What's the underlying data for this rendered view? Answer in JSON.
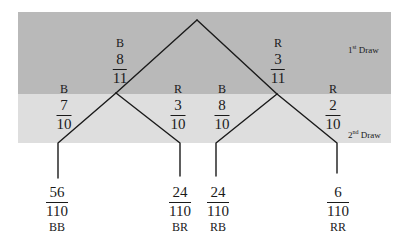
{
  "diagram": {
    "type": "probability-tree",
    "bands": {
      "first": {
        "label_num": "1",
        "label_sup": "st",
        "label_text": " Draw",
        "color": "#b9b9b9"
      },
      "second": {
        "label_num": "2",
        "label_sup": "nd",
        "label_text": " Draw",
        "color": "#dedede"
      }
    },
    "first_draw": [
      {
        "label": "B",
        "numerator": "8",
        "denominator": "11"
      },
      {
        "label": "R",
        "numerator": "3",
        "denominator": "11"
      }
    ],
    "second_draw": [
      {
        "label": "B",
        "numerator": "7",
        "denominator": "10"
      },
      {
        "label": "R",
        "numerator": "3",
        "denominator": "10"
      },
      {
        "label": "B",
        "numerator": "8",
        "denominator": "10"
      },
      {
        "label": "R",
        "numerator": "2",
        "denominator": "10"
      }
    ],
    "outcomes": [
      {
        "code": "BB",
        "numerator": "56",
        "denominator": "110"
      },
      {
        "code": "BR",
        "numerator": "24",
        "denominator": "110"
      },
      {
        "code": "RB",
        "numerator": "24",
        "denominator": "110"
      },
      {
        "code": "RR",
        "numerator": "6",
        "denominator": "110"
      }
    ]
  }
}
